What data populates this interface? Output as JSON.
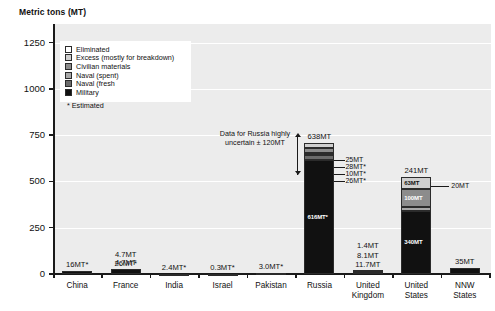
{
  "axis_title": "Metric tons (MT)",
  "legend": {
    "items": [
      {
        "label": "Eliminated",
        "color": "#ffffff"
      },
      {
        "label": "Excess (mostly for breakdown)",
        "color": "#cfcfcf"
      },
      {
        "label": "Civilian materials",
        "color": "#8c8c8c"
      },
      {
        "label": "Naval (spent)",
        "color": "#a8a8a8"
      },
      {
        "label": "Naval (fresh",
        "color": "#6b6b6b"
      },
      {
        "label": "Military",
        "color": "#111111"
      }
    ],
    "note": "*  Estimated"
  },
  "annotations": {
    "russia_note": "Data for Russia highly uncertain ± 120MT"
  },
  "chart_data": {
    "type": "bar",
    "title": "",
    "subtitle": "",
    "xlabel": "",
    "ylabel": "Metric tons (MT)",
    "ylim": [
      0,
      1350
    ],
    "yticks": [
      0,
      250,
      500,
      750,
      1000,
      1250
    ],
    "ytick_labels": [
      "0",
      "250",
      "500",
      "750",
      "1000",
      "1250"
    ],
    "grid": true,
    "stacked": true,
    "legend_position": "inside-top-left",
    "categories": [
      "China",
      "France",
      "India",
      "Israel",
      "Pakistan",
      "Russia",
      "United Kingdom",
      "United States",
      "NNW States"
    ],
    "category_labels": [
      [
        "China"
      ],
      [
        "France"
      ],
      [
        "India"
      ],
      [
        "Israel"
      ],
      [
        "Pakistan"
      ],
      [
        "Russia"
      ],
      [
        "United",
        "Kingdom"
      ],
      [
        "United",
        "States"
      ],
      [
        "NNW",
        "States"
      ]
    ],
    "series": [
      {
        "name": "Military",
        "color": "#111111",
        "values": [
          16,
          26,
          2.4,
          0.3,
          3.0,
          616,
          11.7,
          340,
          35
        ]
      },
      {
        "name": "Naval (fresh",
        "color": "#6b6b6b",
        "values": [
          0,
          0,
          0,
          0,
          0,
          26,
          8.1,
          20,
          0
        ]
      },
      {
        "name": "Naval (spent)",
        "color": "#a8a8a8",
        "values": [
          0,
          0,
          0,
          0,
          0,
          10,
          0,
          100,
          0
        ]
      },
      {
        "name": "Civilian materials",
        "color": "#8c8c8c",
        "values": [
          0,
          0,
          0,
          0,
          0,
          28,
          0,
          0,
          0
        ]
      },
      {
        "name": "Excess (mostly for breakdown)",
        "color": "#cfcfcf",
        "values": [
          0,
          0,
          0,
          0,
          0,
          25,
          0,
          63,
          0
        ]
      },
      {
        "name": "Eliminated",
        "color": "#ffffff",
        "values": [
          0,
          4.7,
          0,
          0,
          0,
          0,
          1.4,
          241,
          0
        ]
      }
    ],
    "bars": [
      {
        "category": "China",
        "total_label": "16MT*",
        "segments": [
          {
            "series": "Military",
            "value": 16,
            "label": null
          }
        ]
      },
      {
        "category": "France",
        "total_label": "4.7MT",
        "above_labels": [
          "4.7MT",
          "26MT*"
        ],
        "segments": [
          {
            "series": "Military",
            "value": 26,
            "label": null
          }
        ]
      },
      {
        "category": "India",
        "total_label": "2.4MT*",
        "segments": [
          {
            "series": "Military",
            "value": 2.4,
            "label": null
          }
        ]
      },
      {
        "category": "Israel",
        "total_label": "0.3MT*",
        "segments": [
          {
            "series": "Military",
            "value": 0.3,
            "label": null
          }
        ]
      },
      {
        "category": "Pakistan",
        "total_label": "3.0MT*",
        "segments": [
          {
            "series": "Military",
            "value": 3.0,
            "label": null
          }
        ]
      },
      {
        "category": "Russia",
        "total_label": "638MT",
        "segments": [
          {
            "series": "Military",
            "value": 616,
            "label": "616MT*"
          },
          {
            "series": "Naval (fresh",
            "value": 26,
            "label": "26MT*"
          },
          {
            "series": "Naval (spent)",
            "value": 10,
            "label": "10MT*"
          },
          {
            "series": "Civilian materials",
            "value": 28,
            "label": "28MT*"
          },
          {
            "series": "Excess (mostly for breakdown)",
            "value": 25,
            "label": "25MT"
          }
        ],
        "callout_labels": [
          "25MT",
          "28MT*",
          "10MT*",
          "26MT*"
        ]
      },
      {
        "category": "United Kingdom",
        "above_labels": [
          "1.4MT",
          "8.1MT",
          "11.7MT"
        ],
        "segments": [
          {
            "series": "Military",
            "value": 11.7,
            "label": null
          },
          {
            "series": "Naval (fresh",
            "value": 8.1,
            "label": null
          },
          {
            "series": "Eliminated",
            "value": 1.4,
            "label": null
          }
        ]
      },
      {
        "category": "United States",
        "total_label": "241MT",
        "segments": [
          {
            "series": "Military",
            "value": 340,
            "label": "340MT"
          },
          {
            "series": "Naval (spent)",
            "value": 20,
            "label": "20MT"
          },
          {
            "series": "Civilian materials",
            "value": 100,
            "label": "100MT"
          },
          {
            "series": "Excess (mostly for breakdown)",
            "value": 63,
            "label": "63MT"
          }
        ],
        "callout_labels": [
          "20MT"
        ]
      },
      {
        "category": "NNW States",
        "total_label": "35MT",
        "segments": [
          {
            "series": "Military",
            "value": 35,
            "label": null
          }
        ]
      }
    ]
  }
}
